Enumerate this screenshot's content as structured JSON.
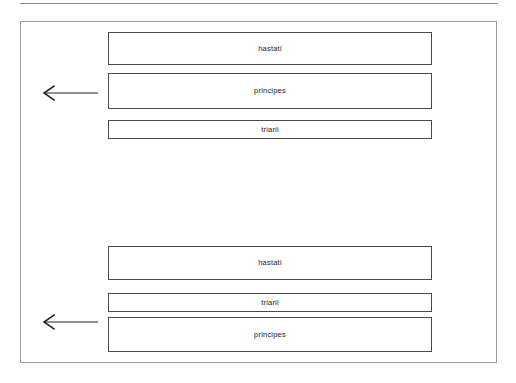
{
  "page": {
    "background_color": "#ffffff",
    "frame_border_color": "#9a9a9a",
    "box_border_color": "#4a4a4a",
    "text_color": "#1a1a1a",
    "arrow_color": "#222222"
  },
  "diagram": {
    "formations": [
      {
        "name": "standard-formation",
        "arrow_label": "advance-direction-arrow",
        "arrow_direction": "left",
        "lines": [
          {
            "label": "hastati"
          },
          {
            "label": "principes"
          },
          {
            "label": "triarii"
          }
        ]
      },
      {
        "name": "alternate-formation",
        "arrow_label": "advance-direction-arrow",
        "arrow_direction": "left",
        "lines": [
          {
            "label": "hastati"
          },
          {
            "label": "triarii"
          },
          {
            "label": "principes"
          }
        ]
      }
    ]
  }
}
